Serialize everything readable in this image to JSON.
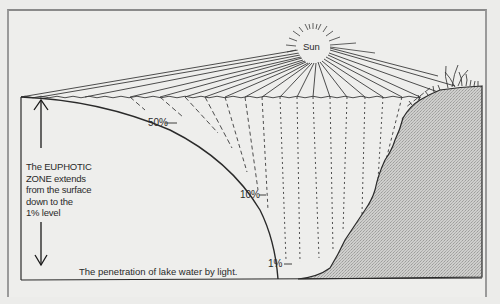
{
  "diagram": {
    "title": "The penetration of lake water by light.",
    "sun_label": "Sun",
    "euphotic_zone_text": "The EUPHOTIC\nZONE extends\nfrom the surface\ndown to the\n1% level",
    "light_levels": [
      {
        "label": "50%"
      },
      {
        "label": "10%"
      },
      {
        "label": "1%"
      }
    ],
    "icons": {
      "up_arrow": "arrow-up-icon",
      "down_arrow": "arrow-down-icon",
      "sun": "sun-icon",
      "vegetation": "grass-icon"
    },
    "colors": {
      "background": "#ececea",
      "line": "#2a2a2a",
      "shore_fill": "#c8c8c6"
    }
  }
}
